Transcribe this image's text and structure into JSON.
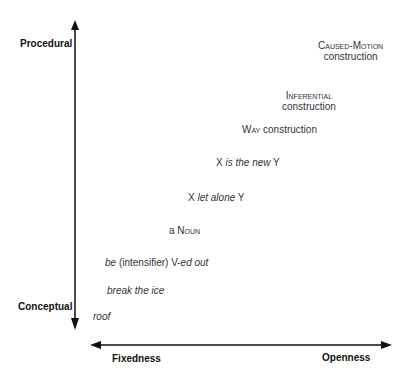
{
  "vertical_axis": {
    "top_label": "Procedural",
    "bottom_label": "Conceptual"
  },
  "horizontal_axis": {
    "left_label": "Fixedness",
    "right_label": "Openness"
  },
  "items": [
    {
      "id": "caused-motion",
      "line1": "Caused-Motion",
      "line2": "construction"
    },
    {
      "id": "inferential",
      "line1": "Inferential",
      "line2": "construction"
    },
    {
      "id": "way",
      "sc": "Way",
      "rest": " construction"
    },
    {
      "id": "x-is-new-y",
      "a": "X ",
      "b": "is the new",
      "c": " Y"
    },
    {
      "id": "x-let-alone-y",
      "a": "X ",
      "b": "let alone",
      "c": " Y"
    },
    {
      "id": "a-noun",
      "a": "a ",
      "b": "Noun"
    },
    {
      "id": "be-intensifier",
      "a": "be",
      "b": " (intensifier) V-",
      "c": "ed out"
    },
    {
      "id": "break-the-ice",
      "text": "break the ice"
    },
    {
      "id": "roof",
      "text": "roof"
    }
  ]
}
